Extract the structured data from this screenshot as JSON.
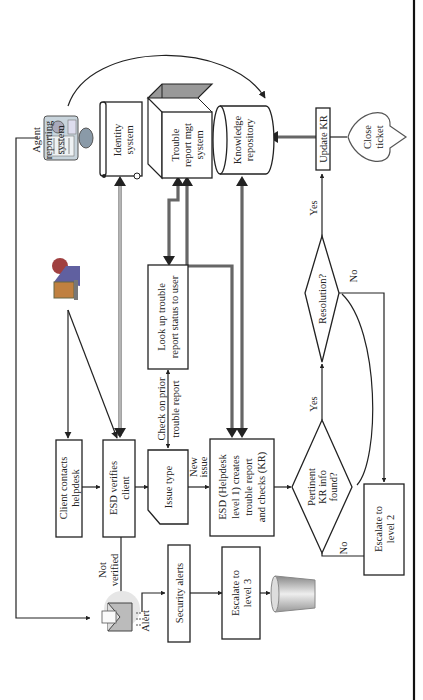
{
  "diagram": {
    "orientation": "rotated-90-ccw",
    "nodes": {
      "agent_reporting": [
        "Agent",
        "reporting",
        "system"
      ],
      "identity": [
        "Identity",
        "system"
      ],
      "trouble_mgt": [
        "Trouble",
        "report mgt",
        "system"
      ],
      "knowledge_repo": [
        "Knowledge",
        "repository"
      ],
      "update_kr": [
        "Update KR"
      ],
      "close_ticket": [
        "Close",
        "ticket"
      ],
      "client_contacts": [
        "Client contacts",
        "helpdesk"
      ],
      "esd_verifies": [
        "ESD verifies",
        "client"
      ],
      "issue_type": [
        "Issue type"
      ],
      "lookup": [
        "Look up trouble",
        "report status to user"
      ],
      "esd_creates": [
        "ESD (Helpdesk",
        "level 1) creates",
        "trouble report",
        "and checks (KR)"
      ],
      "pertinent": [
        "Pertinent",
        "KR info",
        "found?"
      ],
      "resolution": [
        "Resolution?"
      ],
      "escalate2": [
        "Escalate to",
        "level 2"
      ],
      "security_alerts": [
        "Security alerts"
      ],
      "escalate3": [
        "Escalate to",
        "level 3"
      ]
    },
    "edge_labels": {
      "not_verified": [
        "Not",
        "verified"
      ],
      "alert": "Alert",
      "check_prior": [
        "Check on prior",
        "trouble report"
      ],
      "new_issue": [
        "New",
        "issue"
      ],
      "yes_pertinent": "Yes",
      "no_pertinent": "No",
      "yes_resolution": "Yes",
      "no_resolution": "No"
    },
    "icons": {
      "agent": "agent-computer-icon",
      "user": "user-at-computer-icon",
      "alert": "email-alert-icon",
      "trash": "trash-can-icon"
    }
  }
}
